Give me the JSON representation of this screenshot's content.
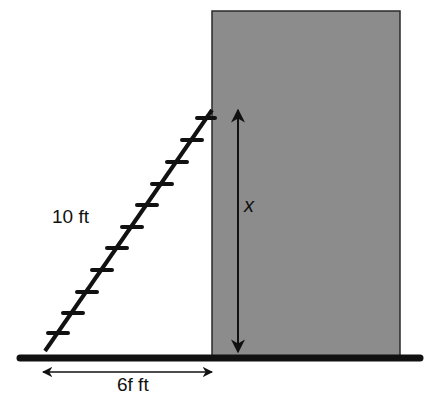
{
  "diagram": {
    "type": "ladder-against-wall",
    "labels": {
      "ladder_length": "10 ft",
      "base_distance": "6f ft",
      "height": "x"
    },
    "colors": {
      "building_fill": "#8c8c8c",
      "building_border": "#2a2a2a",
      "ink": "#111111",
      "background": "#ffffff"
    },
    "building": {
      "x": 212,
      "y": 11,
      "width": 188,
      "height": 345
    },
    "ground": {
      "x1": 20,
      "x2": 420,
      "y": 358
    },
    "ladder": {
      "bottom": [
        45,
        351
      ],
      "top": [
        212,
        110
      ],
      "rung_count": 11
    },
    "height_arrow": {
      "x": 238,
      "y1": 108,
      "y2": 352
    },
    "base_arrow": {
      "y": 372,
      "x1": 42,
      "x2": 213
    }
  }
}
